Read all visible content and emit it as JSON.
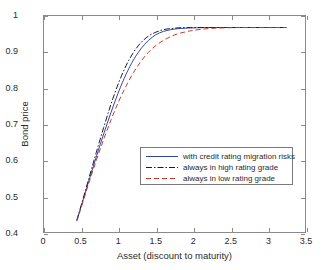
{
  "chart_data": {
    "type": "line",
    "title": "",
    "xlabel": "Asset (discount to maturity)",
    "ylabel": "Bond price",
    "xlim": [
      0,
      3.5
    ],
    "ylim": [
      0.4,
      1
    ],
    "xticks": [
      "0",
      "0.5",
      "1",
      "1.5",
      "2",
      "2.5",
      "3",
      "3.5"
    ],
    "xtick_values": [
      0,
      0.5,
      1,
      1.5,
      2,
      2.5,
      3,
      3.5
    ],
    "yticks": [
      "0.4",
      "0.5",
      "0.6",
      "0.7",
      "0.8",
      "0.9",
      "1"
    ],
    "ytick_values": [
      0.4,
      0.5,
      0.6,
      0.7,
      0.8,
      0.9,
      1
    ],
    "grid": false,
    "legend_position": "center-right",
    "series": [
      {
        "name": "with credit rating migration risks",
        "color": "#2f46a8",
        "style": "solid",
        "x": [
          0.44,
          0.5,
          0.6,
          0.7,
          0.8,
          0.9,
          1.0,
          1.1,
          1.2,
          1.3,
          1.4,
          1.5,
          1.6,
          1.7,
          1.8,
          1.9,
          2.0,
          2.2,
          2.4,
          2.6,
          2.8,
          3.0,
          3.25
        ],
        "y": [
          0.432,
          0.472,
          0.541,
          0.608,
          0.672,
          0.733,
          0.789,
          0.838,
          0.878,
          0.909,
          0.932,
          0.948,
          0.957,
          0.962,
          0.965,
          0.966,
          0.967,
          0.968,
          0.968,
          0.968,
          0.968,
          0.968,
          0.968
        ]
      },
      {
        "name": "always in high rating grade",
        "color": "#1a1a2e",
        "style": "dashdot",
        "x": [
          0.44,
          0.5,
          0.6,
          0.7,
          0.8,
          0.9,
          1.0,
          1.1,
          1.2,
          1.3,
          1.4,
          1.5,
          1.6,
          1.7,
          1.8,
          1.9,
          2.0,
          2.2,
          2.4,
          2.6,
          2.8,
          3.0,
          3.25
        ],
        "y": [
          0.433,
          0.475,
          0.548,
          0.62,
          0.69,
          0.756,
          0.814,
          0.862,
          0.899,
          0.926,
          0.944,
          0.955,
          0.962,
          0.965,
          0.967,
          0.968,
          0.968,
          0.968,
          0.968,
          0.968,
          0.968,
          0.968,
          0.968
        ]
      },
      {
        "name": "always in low rating grade",
        "color": "#c0392b",
        "style": "dashed",
        "x": [
          0.44,
          0.5,
          0.6,
          0.7,
          0.8,
          0.9,
          1.0,
          1.1,
          1.2,
          1.3,
          1.4,
          1.5,
          1.6,
          1.7,
          1.8,
          1.9,
          2.0,
          2.2,
          2.4,
          2.6,
          2.8,
          3.0,
          3.25
        ],
        "y": [
          0.43,
          0.469,
          0.535,
          0.598,
          0.657,
          0.712,
          0.762,
          0.805,
          0.843,
          0.874,
          0.899,
          0.918,
          0.932,
          0.943,
          0.951,
          0.956,
          0.96,
          0.965,
          0.967,
          0.968,
          0.968,
          0.968,
          0.968
        ]
      }
    ]
  },
  "legend": {
    "items": [
      {
        "label": "with credit rating migration risks"
      },
      {
        "label": "always in high rating grade"
      },
      {
        "label": "always in low rating grade"
      }
    ]
  },
  "axes": {
    "xlabel": "Asset (discount to maturity)",
    "ylabel": "Bond price"
  }
}
